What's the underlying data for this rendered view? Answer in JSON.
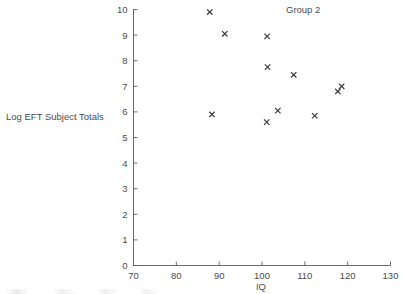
{
  "chart_data": {
    "type": "scatter",
    "title": "Group 2",
    "xlabel": "IQ",
    "ylabel": "Log EFT Subject Totals",
    "xlim": [
      70,
      130
    ],
    "ylim": [
      0,
      10
    ],
    "xticks": [
      70,
      80,
      90,
      100,
      110,
      120,
      130
    ],
    "xtick_labels": [
      "70",
      "80",
      "90",
      "100",
      "110",
      "120",
      "130"
    ],
    "yticks": [
      0,
      1,
      2,
      3,
      4,
      5,
      6,
      7,
      8,
      9,
      10
    ],
    "ytick_labels": [
      "0",
      "1",
      "2",
      "3",
      "4",
      "5",
      "6",
      "7",
      "8",
      "9",
      "10"
    ],
    "grid": false,
    "legend": null,
    "marker": "x",
    "marker_color": "#333333",
    "series": [
      {
        "name": "Group 2",
        "x": [
          87.8,
          91.3,
          101.2,
          101.3,
          107.4,
          118.6,
          117.7,
          103.7,
          88.3,
          112.3,
          101.1
        ],
        "y": [
          9.9,
          9.05,
          8.95,
          7.75,
          7.45,
          7.0,
          6.8,
          6.05,
          5.9,
          5.85,
          5.6
        ]
      }
    ]
  },
  "figure": {
    "title_text": "Group 2",
    "x_axis_title": "IQ",
    "y_axis_title": "Log EFT Subject Totals",
    "point_count": 11
  }
}
